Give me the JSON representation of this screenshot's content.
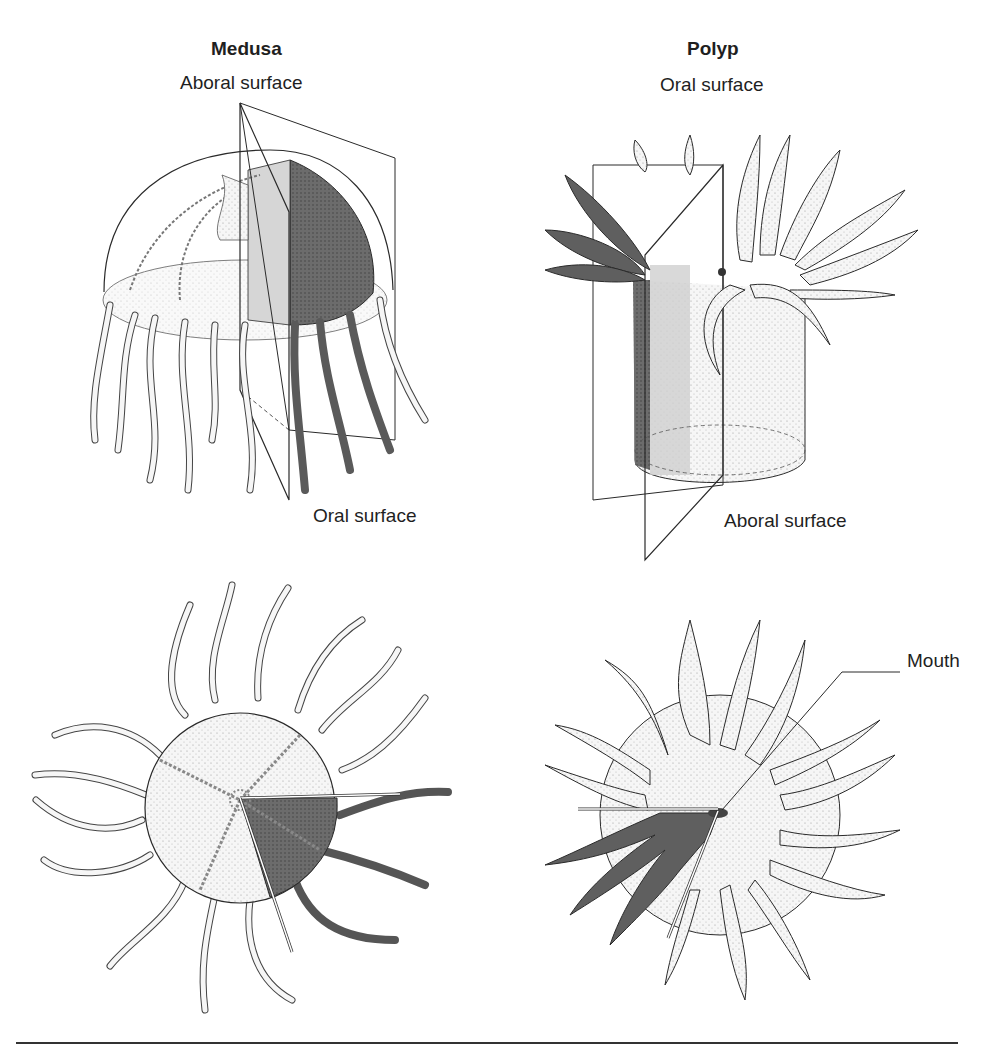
{
  "medusa": {
    "title": "Medusa",
    "top_label": "Aboral surface",
    "bottom_label": "Oral surface"
  },
  "polyp": {
    "title": "Polyp",
    "top_label": "Oral surface",
    "bottom_label": "Aboral surface",
    "mouth_label": "Mouth"
  },
  "colors": {
    "line": "#2a2a2a",
    "light_fill": "#f4f4f4",
    "mid_fill": "#d4d4d4",
    "dark_fill": "#6a6a6a"
  }
}
